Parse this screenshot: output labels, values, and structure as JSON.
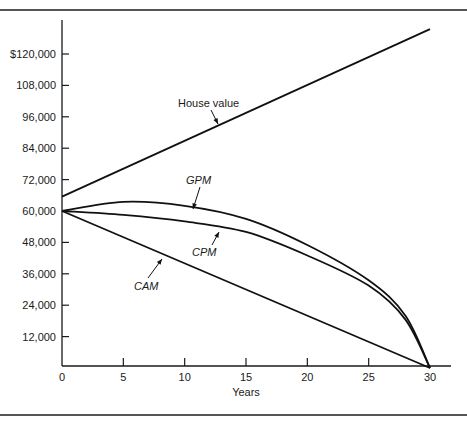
{
  "chart_data": {
    "type": "line",
    "title": "",
    "xlabel": "Years",
    "ylabel": "",
    "xlim": [
      0,
      30
    ],
    "ylim": [
      0,
      130000
    ],
    "grid": false,
    "legend": "inline labels with arrows",
    "x_ticks": [
      0,
      5,
      10,
      15,
      20,
      25,
      30
    ],
    "x_tick_labels": [
      "0",
      "5",
      "10",
      "15",
      "20",
      "25",
      "30"
    ],
    "y_ticks": [
      12000,
      24000,
      36000,
      48000,
      60000,
      72000,
      84000,
      96000,
      108000,
      120000
    ],
    "y_tick_labels": [
      "12,000",
      "24,000",
      "36,000",
      "48,000",
      "60,000",
      "72,000",
      "84,000",
      "96,000",
      "108,000",
      "$120,000"
    ],
    "x": [
      0,
      5,
      10,
      15,
      20,
      25,
      28,
      30
    ],
    "series": [
      {
        "name": "House value",
        "italic": false,
        "values": [
          65500,
          76100,
          86800,
          97500,
          108000,
          118700,
          125000,
          129500
        ]
      },
      {
        "name": "GPM",
        "italic": true,
        "values": [
          60000,
          63500,
          62000,
          57000,
          47000,
          33500,
          20000,
          0
        ]
      },
      {
        "name": "CPM",
        "italic": true,
        "values": [
          60000,
          58500,
          56000,
          52000,
          43000,
          31500,
          18500,
          0
        ]
      },
      {
        "name": "CAM",
        "italic": true,
        "values": [
          60000,
          50000,
          40000,
          30000,
          20000,
          10000,
          4000,
          0
        ]
      }
    ],
    "annotations": [
      {
        "text": "House value",
        "points_to": "House value",
        "at_year": 12
      },
      {
        "text": "GPM",
        "points_to": "GPM",
        "at_year": 11
      },
      {
        "text": "CPM",
        "points_to": "CPM",
        "at_year": 13
      },
      {
        "text": "CAM",
        "points_to": "CAM",
        "at_year": 6
      }
    ]
  }
}
